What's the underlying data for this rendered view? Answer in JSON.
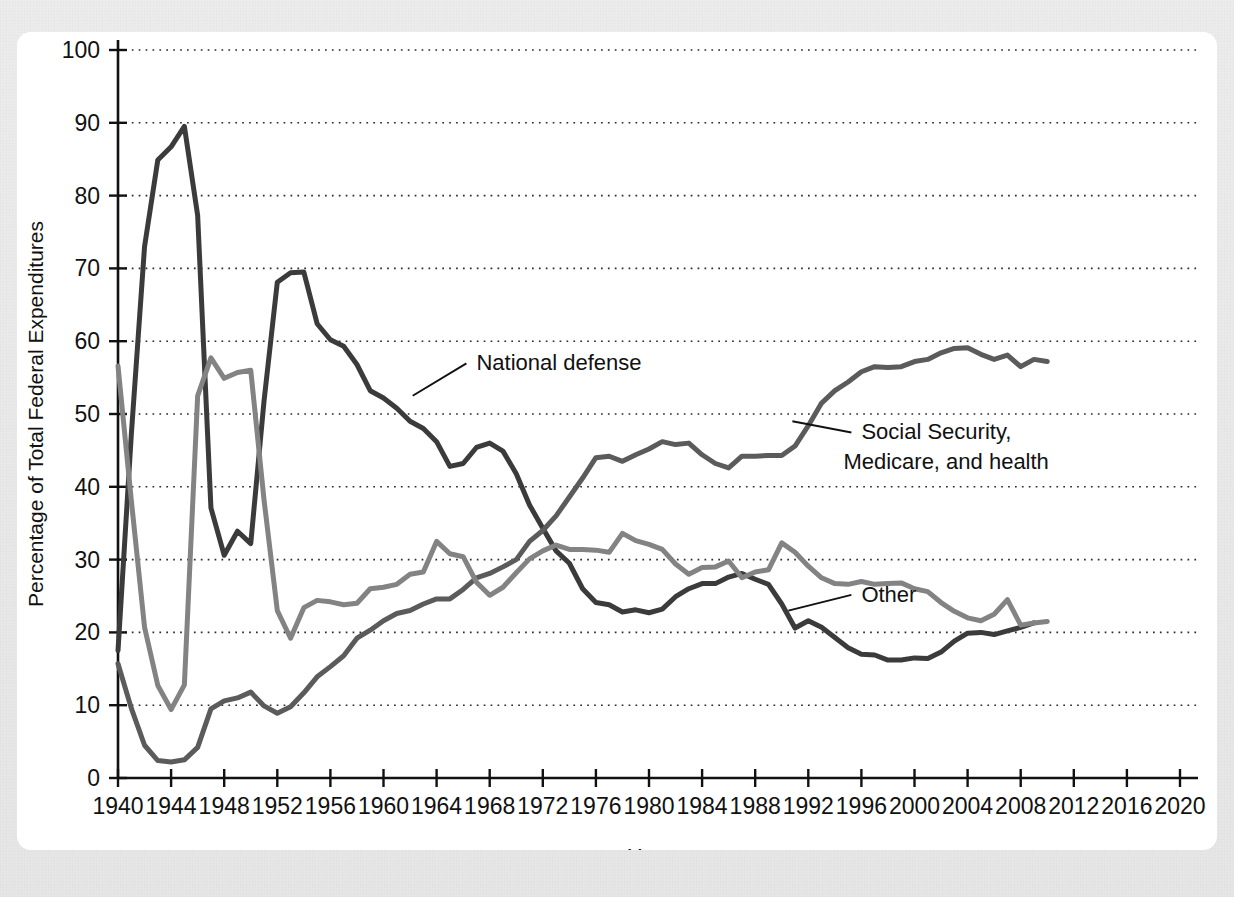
{
  "figure": {
    "ghost_header_text": "",
    "background_color": "#e8e8e8",
    "card_color": "#ffffff"
  },
  "chart_data": {
    "type": "line",
    "title": "",
    "xlabel": "Year",
    "ylabel": "Percentage of Total Federal Expenditures",
    "xlim": [
      1940,
      2020
    ],
    "ylim": [
      0,
      100
    ],
    "grid": true,
    "legend_position": "inline-annotations",
    "xticks": [
      1940,
      1944,
      1948,
      1952,
      1956,
      1960,
      1964,
      1968,
      1972,
      1976,
      1980,
      1984,
      1988,
      1992,
      1996,
      2000,
      2004,
      2008,
      2012,
      2016,
      2020
    ],
    "yticks": [
      0,
      10,
      20,
      30,
      40,
      50,
      60,
      70,
      80,
      90,
      100
    ],
    "series": [
      {
        "name": "National defense",
        "color": "#3b3b3b",
        "stroke_width": 5.0,
        "label_text": "National defense",
        "label_x": 1967.0,
        "label_y": 56.0,
        "leader_from_x": 1962.2,
        "leader_from_y": 52.5,
        "x": [
          1940,
          1941,
          1942,
          1943,
          1944,
          1945,
          1946,
          1947,
          1948,
          1949,
          1950,
          1951,
          1952,
          1953,
          1954,
          1955,
          1956,
          1957,
          1958,
          1959,
          1960,
          1961,
          1962,
          1963,
          1964,
          1965,
          1966,
          1967,
          1968,
          1969,
          1970,
          1971,
          1972,
          1973,
          1974,
          1975,
          1976,
          1977,
          1978,
          1979,
          1980,
          1981,
          1982,
          1983,
          1984,
          1985,
          1986,
          1987,
          1988,
          1989,
          1990,
          1991,
          1992,
          1993,
          1994,
          1995,
          1996,
          1997,
          1998,
          1999,
          2000,
          2001,
          2002,
          2003,
          2004,
          2005,
          2006,
          2007,
          2008,
          2009
        ],
        "values": [
          17.5,
          47.1,
          73.0,
          84.9,
          86.7,
          89.5,
          77.3,
          37.1,
          30.6,
          33.9,
          32.2,
          51.8,
          68.1,
          69.4,
          69.5,
          62.4,
          60.2,
          59.3,
          56.8,
          53.2,
          52.2,
          50.8,
          49.0,
          48.0,
          46.2,
          42.8,
          43.2,
          45.4,
          46.0,
          44.9,
          41.8,
          37.5,
          34.3,
          31.2,
          29.5,
          26.0,
          24.1,
          23.8,
          22.8,
          23.1,
          22.7,
          23.2,
          24.9,
          26.0,
          26.7,
          26.7,
          27.6,
          28.1,
          27.3,
          26.6,
          23.9,
          20.6,
          21.6,
          20.7,
          19.3,
          17.9,
          17.0,
          16.9,
          16.2,
          16.2,
          16.5,
          16.4,
          17.3,
          18.8,
          19.9,
          20.0,
          19.7,
          20.2,
          20.7,
          21.3
        ]
      },
      {
        "name": "Social Security, Medicare, and health",
        "color": "#5b5b5b",
        "stroke_width": 5.0,
        "label_text_line1": "Social Security,",
        "label_text_line2": "Medicare, and health",
        "label_x": 1996.0,
        "label_y": 46.5,
        "leader_from_x": 1990.8,
        "leader_from_y": 49.0,
        "x": [
          1940,
          1941,
          1942,
          1943,
          1944,
          1945,
          1946,
          1947,
          1948,
          1949,
          1950,
          1951,
          1952,
          1953,
          1954,
          1955,
          1956,
          1957,
          1958,
          1959,
          1960,
          1961,
          1962,
          1963,
          1964,
          1965,
          1966,
          1967,
          1968,
          1969,
          1970,
          1971,
          1972,
          1973,
          1974,
          1975,
          1976,
          1977,
          1978,
          1979,
          1980,
          1981,
          1982,
          1983,
          1984,
          1985,
          1986,
          1987,
          1988,
          1989,
          1990,
          1991,
          1992,
          1993,
          1994,
          1995,
          1996,
          1997,
          1998,
          1999,
          2000,
          2001,
          2002,
          2003,
          2004,
          2005,
          2006,
          2007,
          2008,
          2009,
          2010
        ],
        "values": [
          15.7,
          9.6,
          4.5,
          2.4,
          2.2,
          2.5,
          4.2,
          9.5,
          10.6,
          11.0,
          11.8,
          9.9,
          8.9,
          9.8,
          11.7,
          13.9,
          15.3,
          16.8,
          19.2,
          20.3,
          21.6,
          22.6,
          23.0,
          23.9,
          24.6,
          24.6,
          25.9,
          27.5,
          28.1,
          29.0,
          30.0,
          32.5,
          34.0,
          36.0,
          38.6,
          41.2,
          44.0,
          44.2,
          43.5,
          44.4,
          45.2,
          46.2,
          45.8,
          46.0,
          44.4,
          43.2,
          42.6,
          44.2,
          44.2,
          44.3,
          44.3,
          45.6,
          48.4,
          51.5,
          53.2,
          54.4,
          55.8,
          56.5,
          56.4,
          56.5,
          57.2,
          57.5,
          58.4,
          59.0,
          59.1,
          58.2,
          57.5,
          58.1,
          56.5,
          57.5,
          57.2
        ]
      },
      {
        "name": "Other",
        "color": "#838383",
        "stroke_width": 5.0,
        "label_text": "Other",
        "label_x": 1996.0,
        "label_y": 24.2,
        "leader_from_x": 1990.5,
        "leader_from_y": 23.0,
        "x": [
          1940,
          1941,
          1942,
          1943,
          1944,
          1945,
          1946,
          1947,
          1948,
          1949,
          1950,
          1951,
          1952,
          1953,
          1954,
          1955,
          1956,
          1957,
          1958,
          1959,
          1960,
          1961,
          1962,
          1963,
          1964,
          1965,
          1966,
          1967,
          1968,
          1969,
          1970,
          1971,
          1972,
          1973,
          1974,
          1975,
          1976,
          1977,
          1978,
          1979,
          1980,
          1981,
          1982,
          1983,
          1984,
          1985,
          1986,
          1987,
          1988,
          1989,
          1990,
          1991,
          1992,
          1993,
          1994,
          1995,
          1996,
          1997,
          1998,
          1999,
          2000,
          2001,
          2002,
          2003,
          2004,
          2005,
          2006,
          2007,
          2008,
          2009,
          2010
        ],
        "values": [
          56.6,
          38.2,
          20.7,
          12.7,
          9.4,
          12.8,
          52.5,
          57.7,
          54.9,
          55.7,
          56.0,
          38.2,
          23.0,
          19.2,
          23.4,
          24.4,
          24.2,
          23.8,
          24.0,
          26.0,
          26.2,
          26.6,
          28.0,
          28.3,
          32.5,
          30.8,
          30.4,
          26.9,
          25.1,
          26.2,
          28.2,
          30.1,
          31.2,
          32.0,
          31.4,
          31.4,
          31.3,
          31.0,
          33.6,
          32.6,
          32.1,
          31.4,
          29.4,
          28.0,
          28.9,
          29.0,
          29.8,
          27.5,
          28.3,
          28.6,
          32.3,
          31.0,
          29.1,
          27.5,
          26.7,
          26.6,
          27.0,
          26.6,
          26.7,
          26.8,
          26.0,
          25.6,
          24.1,
          22.9,
          22.0,
          21.6,
          22.5,
          24.5,
          21.0,
          21.3,
          21.5
        ]
      }
    ]
  }
}
